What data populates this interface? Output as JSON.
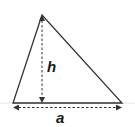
{
  "diagram": {
    "type": "triangle-area",
    "labels": {
      "height": "h",
      "base": "a"
    },
    "colors": {
      "stroke": "#333333",
      "background": "#ffffff"
    },
    "vertices": {
      "apex": [
        42,
        15
      ],
      "bottom_left": [
        13,
        103
      ],
      "bottom_right": [
        122,
        103
      ]
    }
  }
}
